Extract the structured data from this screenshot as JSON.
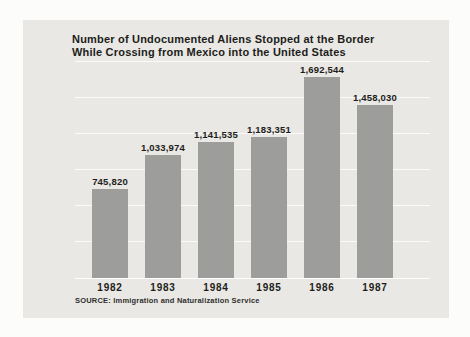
{
  "panel": {
    "title_line1": "Number of Undocumented Aliens Stopped at the Border",
    "title_line2": "While Crossing from Mexico into the United States",
    "source": "SOURCE: Immigration and Naturalization Service"
  },
  "colors": {
    "page_bg": "#fcfcfa",
    "panel_bg": "#e9e8e4",
    "bar": "#9d9d9b",
    "text": "#1d1d1b",
    "gridline": "#f7f7f4"
  },
  "chart_data": {
    "type": "bar",
    "title": "Number of Undocumented Aliens Stopped at the Border While Crossing from Mexico into the United States",
    "categories": [
      "1982",
      "1983",
      "1984",
      "1985",
      "1986",
      "1987"
    ],
    "values": [
      745820,
      1033974,
      1141535,
      1183351,
      1692544,
      1458030
    ],
    "value_labels": [
      "745,820",
      "1,033,974",
      "1,141,535",
      "1,183,351",
      "1,692,544",
      "1,458,030"
    ],
    "xlabel": "",
    "ylabel": "",
    "ylim": [
      0,
      1800000
    ],
    "grid": "faint-horizontal-white-lines",
    "legend": "none",
    "source": "SOURCE: Immigration and Naturalization Service"
  }
}
